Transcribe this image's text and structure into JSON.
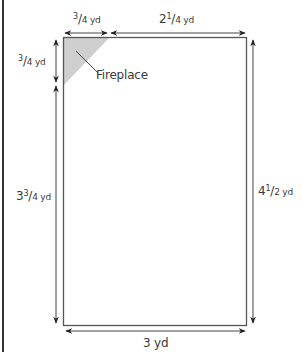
{
  "diagram": {
    "type": "room floor plan",
    "colors": {
      "line": "#4a4a4a",
      "fireplace_fill": "#cfcfcf",
      "text": "#3a3a3a",
      "frame": "#333333"
    },
    "room": {
      "shape": "rectangle with corner fireplace",
      "fireplace_label": "Fireplace"
    },
    "dimensions": {
      "top_left": {
        "whole": "",
        "num": "3",
        "den": "4 yd",
        "text": "3/4 yd"
      },
      "top_right": {
        "whole": "2",
        "num": "1",
        "den": "4 yd",
        "text": "2 1/4 yd"
      },
      "left_top": {
        "whole": "",
        "num": "3",
        "den": "4 yd",
        "text": "3/4 yd"
      },
      "left_bottom": {
        "whole": "3",
        "num": "3",
        "den": "4 yd",
        "text": "3 3/4 yd"
      },
      "right": {
        "whole": "4",
        "num": "1",
        "den": "2 yd",
        "text": "4 1/2 yd"
      },
      "bottom": {
        "text": "3 yd"
      }
    }
  }
}
